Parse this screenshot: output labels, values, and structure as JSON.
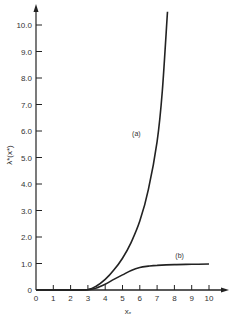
{
  "chart_data": {
    "type": "line",
    "title": "",
    "xlabel": "x*",
    "ylabel": "λ*(x*)",
    "xlim": [
      0,
      10
    ],
    "ylim": [
      0,
      10.5
    ],
    "grid": false,
    "legend": "inline labels",
    "x_ticks": [
      "0",
      "1",
      "2",
      "3",
      "4",
      "5",
      "6",
      "7",
      "8",
      "9",
      "10"
    ],
    "y_ticks": [
      "0",
      "1.0",
      "2.0",
      "3.0",
      "4.0",
      "5.0",
      "6.0",
      "7.0",
      "8.0",
      "9.0",
      "10.0"
    ],
    "series": [
      {
        "name": "(a)",
        "x": [
          0,
          1,
          2,
          3,
          3.5,
          4,
          4.5,
          5,
          5.5,
          6,
          6.5,
          7,
          7.3,
          7.6
        ],
        "y": [
          0,
          0,
          0,
          0.02,
          0.15,
          0.4,
          0.75,
          1.2,
          1.8,
          2.6,
          3.8,
          5.6,
          7.5,
          10.5
        ]
      },
      {
        "name": "(b)",
        "x": [
          0,
          1,
          2,
          3,
          3.5,
          4,
          4.5,
          5,
          5.5,
          6,
          6.5,
          7,
          8,
          9,
          10
        ],
        "y": [
          0,
          0,
          0,
          0.01,
          0.08,
          0.22,
          0.4,
          0.57,
          0.74,
          0.85,
          0.9,
          0.93,
          0.96,
          0.97,
          0.98
        ]
      }
    ],
    "annotations": [
      {
        "text": "(a)",
        "x": 5.8,
        "y": 5.8
      },
      {
        "text": "(b)",
        "x": 8.3,
        "y": 1.2
      }
    ]
  },
  "labels": {
    "xlabel": "x",
    "xlabel_sub": "*",
    "ylabel": "λ*(x*)",
    "curve_a": "(a)",
    "curve_b": "(b)"
  }
}
